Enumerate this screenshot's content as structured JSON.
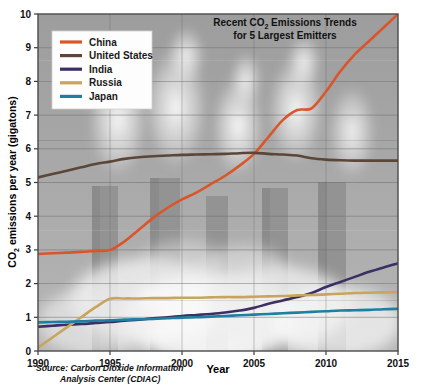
{
  "chart_data": {
    "type": "line",
    "title": "Recent CO2 Emissions Trends for 5 Largest Emitters",
    "title_line1": "Recent CO",
    "title_line1_sub": "2",
    "title_line1_rest": " Emissions Trends",
    "title_line2": "for 5 Largest Emitters",
    "xlabel": "Year",
    "ylabel": "CO2 emissions per year (gigatons)",
    "ylabel_pre": "CO",
    "ylabel_sub": "2",
    "ylabel_post": " emissions per year (gigatons)",
    "xlim": [
      1990,
      2015
    ],
    "ylim": [
      0,
      10
    ],
    "xticks": [
      "1990",
      "1995",
      "2000",
      "2005",
      "2010",
      "2015"
    ],
    "xtick_values": [
      1990,
      1995,
      2000,
      2005,
      2010,
      2015
    ],
    "yticks": [
      "0",
      "1",
      "2",
      "3",
      "4",
      "5",
      "6",
      "7",
      "8",
      "9",
      "10"
    ],
    "ytick_values": [
      0,
      1,
      2,
      3,
      4,
      5,
      6,
      7,
      8,
      9,
      10
    ],
    "grid": true,
    "legend_position": "top-left",
    "source": "Source: Carbon Dioxide Information Analysis Center (CDIAC)",
    "source_line1": "Source: Carbon Dioxide Information",
    "source_line2": "Analysis Center (CDIAC)",
    "x": [
      1990,
      1991,
      1992,
      1993,
      1994,
      1995,
      1996,
      1997,
      1998,
      1999,
      2000,
      2001,
      2002,
      2003,
      2004,
      2005,
      2006,
      2007,
      2008,
      2009,
      2010,
      2011,
      2012,
      2013,
      2014,
      2015
    ],
    "series": [
      {
        "name": "China",
        "color": "#d9562b",
        "values": [
          2.88,
          2.9,
          2.92,
          2.94,
          2.97,
          3.0,
          3.25,
          3.6,
          3.95,
          4.25,
          4.5,
          4.7,
          4.95,
          5.2,
          5.5,
          5.85,
          6.35,
          6.85,
          7.15,
          7.2,
          7.7,
          8.3,
          8.8,
          9.2,
          9.6,
          10.0
        ]
      },
      {
        "name": "United States",
        "color": "#5b4638",
        "values": [
          5.15,
          5.25,
          5.35,
          5.45,
          5.55,
          5.62,
          5.7,
          5.75,
          5.78,
          5.8,
          5.82,
          5.83,
          5.84,
          5.85,
          5.87,
          5.88,
          5.85,
          5.83,
          5.8,
          5.72,
          5.68,
          5.66,
          5.65,
          5.65,
          5.65,
          5.65
        ]
      },
      {
        "name": "India",
        "color": "#3c2f63",
        "values": [
          0.72,
          0.75,
          0.78,
          0.8,
          0.83,
          0.86,
          0.9,
          0.93,
          0.97,
          1.0,
          1.04,
          1.07,
          1.1,
          1.14,
          1.2,
          1.28,
          1.4,
          1.5,
          1.6,
          1.72,
          1.9,
          2.05,
          2.2,
          2.35,
          2.48,
          2.6
        ]
      },
      {
        "name": "Russia",
        "color": "#c8a45c",
        "values": [
          0.1,
          0.4,
          0.7,
          1.0,
          1.3,
          1.55,
          1.56,
          1.56,
          1.57,
          1.57,
          1.58,
          1.58,
          1.59,
          1.6,
          1.6,
          1.61,
          1.62,
          1.63,
          1.65,
          1.66,
          1.68,
          1.7,
          1.72,
          1.73,
          1.74,
          1.75
        ]
      },
      {
        "name": "Japan",
        "color": "#1f7fa0",
        "values": [
          0.85,
          0.86,
          0.87,
          0.88,
          0.9,
          0.91,
          0.93,
          0.94,
          0.95,
          0.97,
          0.99,
          1.0,
          1.02,
          1.04,
          1.06,
          1.08,
          1.1,
          1.12,
          1.14,
          1.16,
          1.18,
          1.2,
          1.21,
          1.22,
          1.24,
          1.25
        ]
      }
    ]
  },
  "legend": {
    "entries": [
      {
        "label": "China"
      },
      {
        "label": "United States"
      },
      {
        "label": "India"
      },
      {
        "label": "Russia"
      },
      {
        "label": "Japan"
      }
    ]
  }
}
